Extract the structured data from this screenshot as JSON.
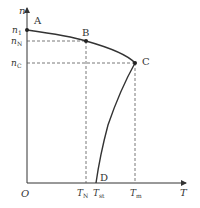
{
  "diagram": {
    "axes": {
      "y_label": "n",
      "x_label": "T",
      "origin_label": "O",
      "y_ticks": [
        {
          "label": "n",
          "sub": "1",
          "y": 30
        },
        {
          "label": "n",
          "sub": "N",
          "y": 41
        },
        {
          "label": "n",
          "sub": "C",
          "y": 63
        }
      ],
      "x_ticks": [
        {
          "label": "T",
          "sub": "N",
          "x": 86
        },
        {
          "label": "T",
          "sub": "st",
          "x": 96
        },
        {
          "label": "T",
          "sub": "m",
          "x": 135
        }
      ]
    },
    "points": [
      {
        "name": "A",
        "x": 27,
        "y": 30
      },
      {
        "name": "B",
        "x": 86,
        "y": 41
      },
      {
        "name": "C",
        "x": 135,
        "y": 63
      },
      {
        "name": "D",
        "x": 96,
        "y": 183
      }
    ],
    "colors": {
      "line": "#333333",
      "dash": "#555555"
    }
  }
}
